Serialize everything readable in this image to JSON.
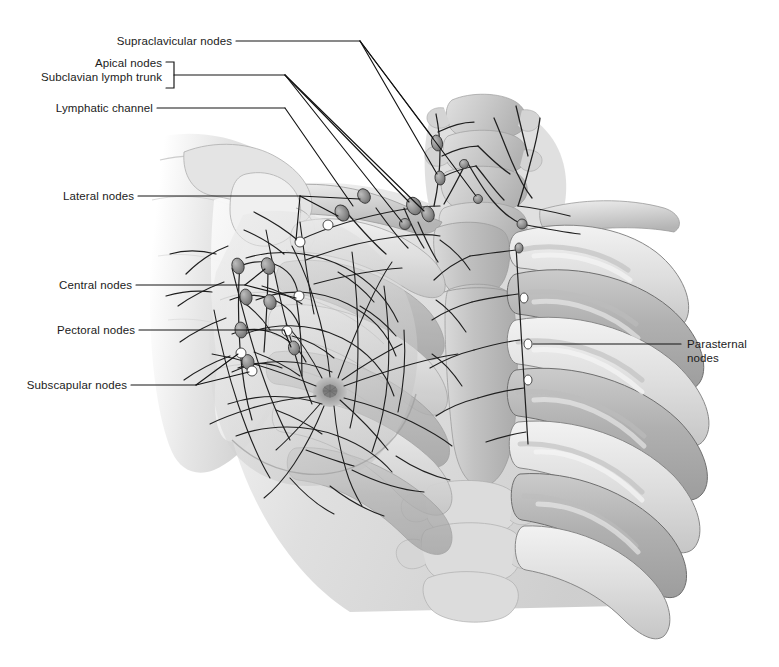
{
  "figure": {
    "width": 779,
    "height": 667,
    "background_color": "#ffffff",
    "label_color": "#1b1b1b",
    "leader_line_color": "#1a1a1a",
    "view": "anterior view of male/female chest, right side, with ribcage and axilla"
  },
  "labels": {
    "supraclavicular": "Supraclavicular nodes",
    "apical": "Apical nodes",
    "subclavian_trunk": "Subclavian lymph trunk",
    "lymphatic_channel": "Lymphatic channel",
    "lateral": "Lateral nodes",
    "central": "Central nodes",
    "pectoral": "Pectoral nodes",
    "subscapular": "Subscapular nodes",
    "parasternal_line1": "Parasternal",
    "parasternal_line2": "nodes"
  },
  "anatomy": {
    "structures": [
      "cervical vertebrae",
      "clavicle",
      "scapula",
      "humeral head",
      "sternum",
      "manubrium",
      "ribs",
      "costal cartilages",
      "breast",
      "nipple and areola",
      "deltoid soft tissue",
      "upper arm"
    ],
    "node_groups": [
      "supraclavicular nodes",
      "apical nodes",
      "lateral nodes",
      "central nodes",
      "pectoral nodes",
      "subscapular nodes",
      "parasternal nodes"
    ],
    "tones": {
      "bone_light": "#e3e3e3",
      "bone_mid": "#c4c4c4",
      "bone_dark": "#a3a3a3",
      "soft_tissue": "#d8d8d8",
      "vessel": "#2a2a2a",
      "node_fill": "#9a9a9a"
    }
  }
}
